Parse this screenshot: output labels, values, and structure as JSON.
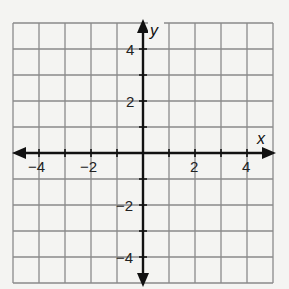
{
  "chart_data": {
    "type": "coordinate_grid",
    "title": "",
    "xlabel": "x",
    "ylabel": "y",
    "xlim": [
      -5,
      5
    ],
    "ylim": [
      -5,
      5
    ],
    "grid": true,
    "grid_step": 1,
    "x_tick_labels": [
      "-4",
      "-2",
      "2",
      "4"
    ],
    "x_tick_values": [
      -4,
      -2,
      2,
      4
    ],
    "y_tick_labels": [
      "4",
      "2",
      "-2",
      "-4"
    ],
    "y_tick_values": [
      4,
      2,
      -2,
      -4
    ],
    "axes_arrows": true,
    "series": []
  },
  "labels": {
    "x_axis": "x",
    "y_axis": "y",
    "x_neg4": "−4",
    "x_neg2": "−2",
    "x_pos2": "2",
    "x_pos4": "4",
    "y_pos4": "4",
    "y_pos2": "2",
    "y_neg2": "−2",
    "y_neg4": "−4"
  },
  "colors": {
    "background": "#f4f4f2",
    "grid": "#8a8a8a",
    "axis": "#111111"
  }
}
